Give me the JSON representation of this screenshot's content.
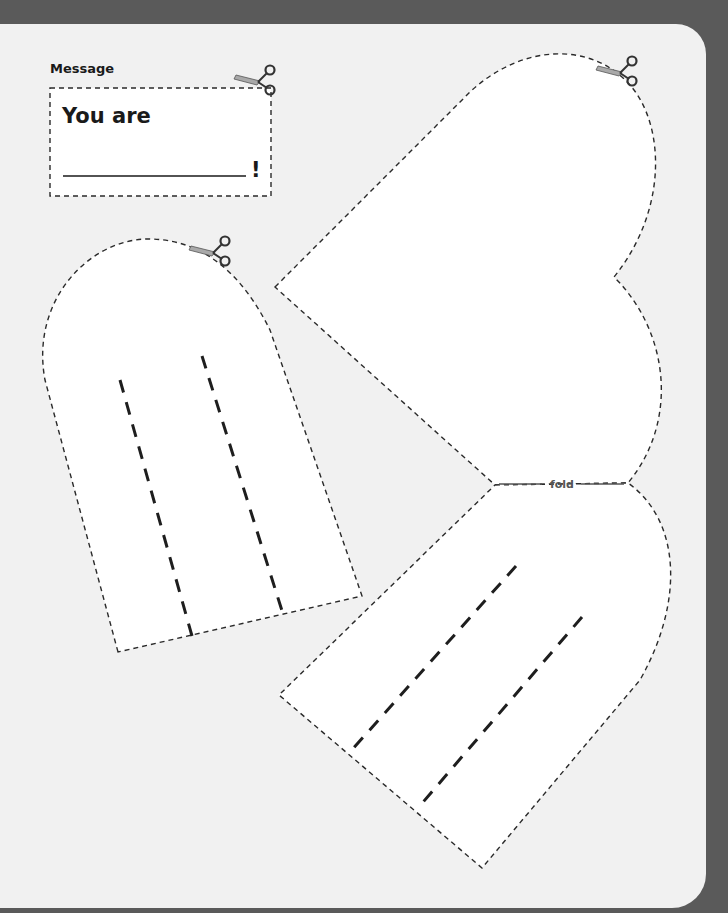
{
  "message_card": {
    "label": "Message",
    "line1": "You are",
    "ending": "!"
  },
  "fold_label": "fold",
  "icons": [
    "scissors-icon",
    "scissors-icon",
    "scissors-icon"
  ],
  "colors": {
    "page": "#f1f1f1",
    "background": "#5a5a5a",
    "cutout": "#ffffff",
    "ink": "#1a1a1a",
    "scissor_blade": "#a9a9a9"
  }
}
